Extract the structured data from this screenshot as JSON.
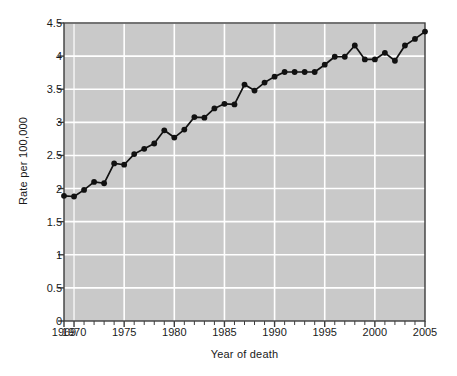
{
  "chart_data": {
    "type": "line",
    "title": "",
    "xlabel": "Year of death",
    "ylabel": "Rate per 100,000",
    "xlim": [
      1969,
      2005
    ],
    "ylim": [
      0,
      4.5
    ],
    "grid": true,
    "legend": null,
    "x_tick_labels": [
      "1969",
      "1970",
      "1975",
      "1980",
      "1985",
      "1990",
      "1995",
      "2000",
      "2005"
    ],
    "x_tick_values": [
      1969,
      1970,
      1975,
      1980,
      1985,
      1990,
      1995,
      2000,
      2005
    ],
    "y_tick_labels": [
      "0",
      "0.5",
      "1",
      "1.5",
      "2",
      "2.5",
      "3",
      "3.5",
      "4",
      "4.5"
    ],
    "y_tick_values": [
      0,
      0.5,
      1,
      1.5,
      2,
      2.5,
      3,
      3.5,
      4,
      4.5
    ],
    "minor_x_ticks": true,
    "series": [
      {
        "name": "Rate per 100,000",
        "marker": "circle",
        "color": "#111111",
        "x": [
          1969,
          1970,
          1971,
          1972,
          1973,
          1974,
          1975,
          1976,
          1977,
          1978,
          1979,
          1980,
          1981,
          1982,
          1983,
          1984,
          1985,
          1986,
          1987,
          1988,
          1989,
          1990,
          1991,
          1992,
          1993,
          1994,
          1995,
          1996,
          1997,
          1998,
          1999,
          2000,
          2001,
          2002,
          2003,
          2004,
          2005
        ],
        "values": [
          1.89,
          1.88,
          1.98,
          2.1,
          2.08,
          2.38,
          2.36,
          2.52,
          2.6,
          2.68,
          2.88,
          2.77,
          2.89,
          3.08,
          3.07,
          3.21,
          3.28,
          3.27,
          3.57,
          3.48,
          3.6,
          3.69,
          3.76,
          3.76,
          3.76,
          3.76,
          3.87,
          3.99,
          3.99,
          4.16,
          3.95,
          3.95,
          4.05,
          3.93,
          4.16,
          4.26,
          4.37
        ]
      }
    ],
    "colors": {
      "plot_background": "#c9c9c9",
      "grid": "#ffffff",
      "axis": "#3d3d3d",
      "line": "#111111",
      "marker": "#111111",
      "figure_background": "#ffffff",
      "text": "#1a1a1a"
    }
  }
}
